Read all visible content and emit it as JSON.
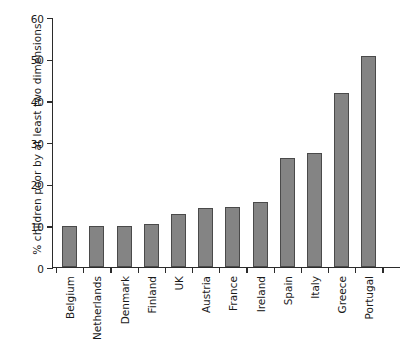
{
  "chart_data": {
    "type": "bar",
    "title": "",
    "subtitle": "",
    "xlabel": "",
    "ylabel": "% children poor by at least two dimensions",
    "categories": [
      "Belgium",
      "Netherlands",
      "Denmark",
      "Finland",
      "UK",
      "Austria",
      "France",
      "Ireland",
      "Spain",
      "Italy",
      "Greece",
      "Portugal"
    ],
    "values": [
      9.7,
      9.7,
      9.8,
      10.2,
      12.6,
      14.0,
      14.4,
      15.6,
      26.0,
      27.2,
      41.7,
      50.6
    ],
    "ylim": [
      0,
      60
    ],
    "y_ticks": [
      0,
      10,
      20,
      30,
      40,
      50,
      60
    ],
    "y_tick_labels": [
      "0",
      "10",
      "20",
      "30",
      "40",
      "50",
      "60"
    ],
    "grid": false,
    "legend": false,
    "legend_position": "none",
    "bar_fill_color": "#848484",
    "bar_edge_color": "#4a4a4a",
    "axis_color": "#2b2b2b",
    "background_color": "#ffffff",
    "x_tick_style": "between-bars"
  }
}
